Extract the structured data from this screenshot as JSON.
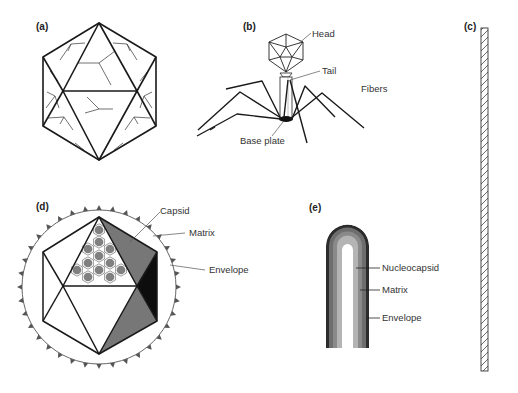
{
  "figure": {
    "panels": [
      {
        "id": "a",
        "label": "(a)",
        "subject": "icosahedral capsid"
      },
      {
        "id": "b",
        "label": "(b)",
        "subject": "bacteriophage",
        "labels": {
          "head": "Head",
          "tail": "Tail",
          "fibers": "Fibers",
          "base_plate": "Base plate"
        }
      },
      {
        "id": "c",
        "label": "(c)",
        "subject": "helical rod"
      },
      {
        "id": "d",
        "label": "(d)",
        "subject": "enveloped icosahedral virus",
        "labels": {
          "capsid": "Capsid",
          "matrix": "Matrix",
          "envelope": "Envelope"
        }
      },
      {
        "id": "e",
        "label": "(e)",
        "subject": "enveloped helical virus",
        "labels": {
          "nucleocapsid": "Nucleocapsid",
          "matrix": "Matrix",
          "envelope": "Envelope"
        }
      }
    ]
  },
  "colors": {
    "line": "#1a1a1a",
    "gray_face": "#777777",
    "black_face": "#0d0d0d",
    "capsomere": "#808080",
    "envelope_outer": "#3a3a3a",
    "matrix_band": "#6e6e6e",
    "nucleocapsid_band": "#a8a8a8",
    "core": "#ffffff"
  }
}
